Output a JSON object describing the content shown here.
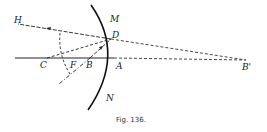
{
  "figure": {
    "caption": "Fig. 136.",
    "labels": {
      "H": "H",
      "M": "M",
      "D": "D",
      "C": "C",
      "F": "F",
      "B": "B",
      "A": "A",
      "N": "N",
      "B_prime": "B'"
    },
    "colors": {
      "ink": "#222222",
      "background": "#ffffff"
    },
    "elements": [
      "concave mirror arc MN",
      "principal axis through C, F, B, A",
      "incident ray from B to D with arrow",
      "reflected ray from D toward H with arrow",
      "dashed normal CD",
      "dashed virtual extension from D to B'",
      "dashed axis extension from A to B'",
      "dashed arc about D",
      "dash-dot line through D and B"
    ]
  }
}
